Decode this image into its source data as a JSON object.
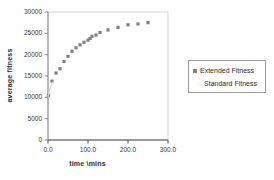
{
  "chart_data": {
    "type": "scatter",
    "title": "",
    "xlabel": "time \\mins",
    "ylabel": "average fitness",
    "xlim": [
      0,
      300
    ],
    "ylim": [
      0,
      30000
    ],
    "xticks": [
      "0.0",
      "100.0",
      "200.0",
      "300.0"
    ],
    "xtick_values": [
      0,
      100,
      200,
      300
    ],
    "yticks": [
      "0",
      "5000",
      "10000",
      "15000",
      "20000",
      "25000",
      "30000"
    ],
    "ytick_values": [
      0,
      5000,
      10000,
      15000,
      20000,
      25000,
      30000
    ],
    "grid": false,
    "legend_position": "right-outside",
    "series": [
      {
        "name": "Extended Fitness",
        "color": "#808080",
        "marker": "square",
        "x": [
          1,
          10,
          20,
          30,
          40,
          50,
          60,
          70,
          80,
          90,
          100,
          105,
          110,
          120,
          130,
          150,
          175,
          200,
          225,
          250
        ],
        "y": [
          10500,
          13800,
          15700,
          16700,
          18400,
          19600,
          20800,
          21600,
          22300,
          22900,
          23400,
          23800,
          24300,
          24600,
          25200,
          25800,
          26400,
          27000,
          27200,
          27500
        ]
      },
      {
        "name": "Standard Fitness",
        "color": "#d8d8d8",
        "marker": "none",
        "x": [
          0,
          3,
          6,
          9,
          12
        ],
        "y": [
          10200,
          11300,
          12300,
          13000,
          13600
        ]
      }
    ]
  },
  "legend": {
    "entries": [
      {
        "label": "Extended Fitness",
        "color": "#808080"
      },
      {
        "label": "Standard Fitness",
        "color": "#fbfbfb"
      }
    ]
  }
}
